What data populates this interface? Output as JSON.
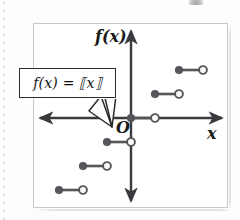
{
  "figure": {
    "kind": "coordinate-graph",
    "function_label": "f(x) = ⟦x⟧",
    "axis_vertical_label": "f(x)",
    "axis_horizontal_label": "x",
    "origin_label": "O",
    "colors": {
      "axis": "#3b3b3f",
      "step": "#55555a",
      "frame": "#c8c8cc",
      "callout_border": "#2b2b2b",
      "text": "#1a1a1a",
      "page": "#fdfdfc",
      "margin_dots": "#cfcfd4"
    },
    "geometry": {
      "frame": {
        "x": 33,
        "y": 23,
        "width": 195,
        "height": 185
      },
      "origin": {
        "x": 131,
        "y": 118
      },
      "unit_x": 24,
      "unit_y": 24,
      "x_axis_y": 118,
      "y_axis_x": 131,
      "x_axis_from": 40,
      "x_axis_to": 222,
      "y_axis_from": 30,
      "y_axis_to": 202
    },
    "callout": {
      "x": 19,
      "y": 68,
      "width": 97,
      "height": 30,
      "tail_points": [
        "114,98 112,126 98,110",
        "100,98 112,126 92,112"
      ]
    },
    "chart_data": {
      "type": "scatter",
      "title": "Greatest integer (floor) step function",
      "xlabel": "x",
      "ylabel": "f(x)",
      "function": "f(x) = [[x]]",
      "description": "Step function: each unit interval [n, n+1) maps to the constant value n, drawn as a horizontal segment with a closed dot at the left endpoint and an open circle at the right endpoint.",
      "steps": [
        {
          "n": -3,
          "domain": [
            -3,
            -2
          ],
          "value": -3,
          "closed": {
            "x": 59,
            "y": 190
          },
          "open": {
            "x": 83,
            "y": 190
          }
        },
        {
          "n": -2,
          "domain": [
            -2,
            -1
          ],
          "value": -2,
          "closed": {
            "x": 83,
            "y": 166
          },
          "open": {
            "x": 107,
            "y": 166
          }
        },
        {
          "n": -1,
          "domain": [
            -1,
            0
          ],
          "value": -1,
          "closed": {
            "x": 107,
            "y": 142
          },
          "open": {
            "x": 131,
            "y": 142
          }
        },
        {
          "n": 0,
          "domain": [
            0,
            1
          ],
          "value": 0,
          "closed": {
            "x": 131,
            "y": 118
          },
          "open": {
            "x": 155,
            "y": 118
          }
        },
        {
          "n": 1,
          "domain": [
            1,
            2
          ],
          "value": 1,
          "closed": {
            "x": 155,
            "y": 94
          },
          "open": {
            "x": 179,
            "y": 94
          }
        },
        {
          "n": 2,
          "domain": [
            2,
            3
          ],
          "value": 2,
          "closed": {
            "x": 179,
            "y": 70
          },
          "open": {
            "x": 203,
            "y": 70
          }
        }
      ],
      "grid": false,
      "legend": false,
      "annotations": [
        {
          "text": "f(x) = [[x]]",
          "target": "step at n = -1"
        },
        {
          "text": "O",
          "target": "origin"
        }
      ]
    }
  }
}
